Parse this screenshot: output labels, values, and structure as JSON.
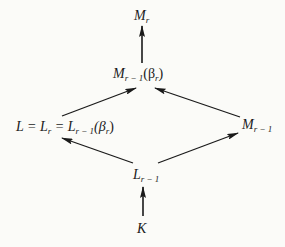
{
  "diagram": {
    "type": "lattice of field extensions",
    "nodes": {
      "top": {
        "main": "M",
        "sub": "r",
        "rest": ""
      },
      "upper": {
        "main": "M",
        "sub": "r − 1",
        "rest": "(β",
        "rest_sub": "r",
        "rest_end": ")"
      },
      "left": {
        "text1": "L = L",
        "sub1": "r",
        "text2": " = L",
        "sub2": "r − 1",
        "text3": "(β",
        "sub3": "r",
        "text4": ")"
      },
      "right": {
        "main": "M",
        "sub": "r − 1"
      },
      "lower": {
        "main": "L",
        "sub": "r − 1"
      },
      "bottom": {
        "main": "K"
      }
    },
    "edges": [
      {
        "from": "upper",
        "to": "top"
      },
      {
        "from": "left",
        "to": "upper"
      },
      {
        "from": "right",
        "to": "upper"
      },
      {
        "from": "lower",
        "to": "left"
      },
      {
        "from": "lower",
        "to": "right"
      },
      {
        "from": "bottom",
        "to": "lower"
      }
    ],
    "colors": {
      "ink": "#1a1a1a",
      "background": "#fbfbf8"
    }
  }
}
